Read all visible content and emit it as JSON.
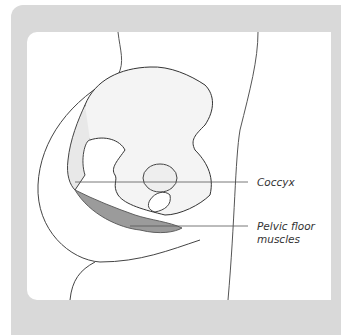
{
  "figure": {
    "labels": [
      {
        "id": "coccyx",
        "text": "Coccyx"
      },
      {
        "id": "pelvic_floor",
        "text_line1": "Pelvic floor",
        "text_line2": "muscles"
      }
    ]
  },
  "colors": {
    "frame": "#d9d9d9",
    "panel": "#ffffff",
    "line": "#444444",
    "muscle": "#8a8a8a"
  }
}
